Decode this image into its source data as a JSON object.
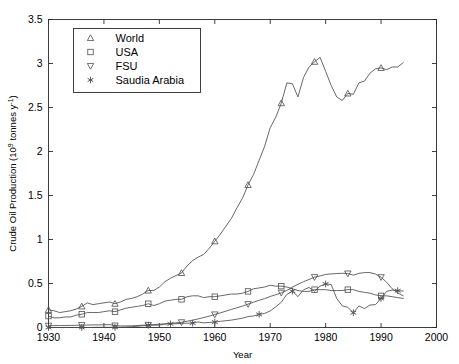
{
  "chart_data": {
    "type": "line",
    "title": "",
    "xlabel": "Year",
    "ylabel": "Crude Oil Production (10^9 tonnes y^-1)",
    "ylabel_parts": {
      "main": "Crude Oil Production (10",
      "exp1": "9",
      "mid": " tonnes y",
      "exp2": "-1",
      "tail": ")"
    },
    "xlim": [
      1930,
      2000
    ],
    "ylim": [
      0,
      3.5
    ],
    "xticks": [
      1930,
      1940,
      1950,
      1960,
      1970,
      1980,
      1990,
      2000
    ],
    "yticks": [
      0,
      0.5,
      1,
      1.5,
      2,
      2.5,
      3,
      3.5
    ],
    "xtick_labels": [
      "1930",
      "1940",
      "1950",
      "1960",
      "1970",
      "1980",
      "1990",
      "2000"
    ],
    "ytick_labels": [
      "0",
      "0.5",
      "1",
      "1.5",
      "2",
      "2.5",
      "3",
      "3.5"
    ],
    "grid": false,
    "legend_position": "upper-left",
    "line_color": "#4d4d4d",
    "series": [
      {
        "name": "World",
        "marker": "triangle-up",
        "marker_years": [
          1930,
          1936,
          1942,
          1948,
          1954,
          1960,
          1966,
          1972,
          1978,
          1984,
          1990
        ],
        "x": [
          1930,
          1931,
          1932,
          1933,
          1934,
          1935,
          1936,
          1937,
          1938,
          1939,
          1940,
          1941,
          1942,
          1943,
          1944,
          1945,
          1946,
          1947,
          1948,
          1949,
          1950,
          1951,
          1952,
          1953,
          1954,
          1955,
          1956,
          1957,
          1958,
          1959,
          1960,
          1961,
          1962,
          1963,
          1964,
          1965,
          1966,
          1967,
          1968,
          1969,
          1970,
          1971,
          1972,
          1973,
          1974,
          1975,
          1976,
          1977,
          1978,
          1979,
          1980,
          1981,
          1982,
          1983,
          1984,
          1985,
          1986,
          1987,
          1988,
          1989,
          1990,
          1991,
          1992,
          1993,
          1994
        ],
        "y": [
          0.2,
          0.19,
          0.17,
          0.18,
          0.19,
          0.21,
          0.24,
          0.28,
          0.26,
          0.27,
          0.28,
          0.29,
          0.27,
          0.29,
          0.32,
          0.33,
          0.35,
          0.38,
          0.42,
          0.42,
          0.46,
          0.52,
          0.56,
          0.59,
          0.62,
          0.7,
          0.76,
          0.8,
          0.83,
          0.9,
          0.98,
          1.06,
          1.15,
          1.24,
          1.36,
          1.47,
          1.62,
          1.74,
          1.9,
          2.06,
          2.27,
          2.39,
          2.55,
          2.78,
          2.77,
          2.62,
          2.84,
          2.96,
          3.02,
          3.07,
          2.91,
          2.75,
          2.62,
          2.58,
          2.66,
          2.65,
          2.78,
          2.8,
          2.89,
          2.94,
          2.95,
          2.93,
          2.96,
          2.96,
          3.01
        ]
      },
      {
        "name": "USA",
        "marker": "square",
        "marker_years": [
          1930,
          1936,
          1942,
          1948,
          1954,
          1960,
          1966,
          1972,
          1978,
          1984,
          1990
        ],
        "x": [
          1930,
          1931,
          1932,
          1933,
          1934,
          1935,
          1936,
          1937,
          1938,
          1939,
          1940,
          1941,
          1942,
          1943,
          1944,
          1945,
          1946,
          1947,
          1948,
          1949,
          1950,
          1951,
          1952,
          1953,
          1954,
          1955,
          1956,
          1957,
          1958,
          1959,
          1960,
          1961,
          1962,
          1963,
          1964,
          1965,
          1966,
          1967,
          1968,
          1969,
          1970,
          1971,
          1972,
          1973,
          1974,
          1975,
          1976,
          1977,
          1978,
          1979,
          1980,
          1981,
          1982,
          1983,
          1984,
          1985,
          1986,
          1987,
          1988,
          1989,
          1990,
          1991,
          1992,
          1993,
          1994
        ],
        "y": [
          0.13,
          0.11,
          0.11,
          0.12,
          0.12,
          0.14,
          0.15,
          0.17,
          0.17,
          0.17,
          0.18,
          0.19,
          0.18,
          0.2,
          0.22,
          0.23,
          0.24,
          0.25,
          0.27,
          0.25,
          0.27,
          0.3,
          0.31,
          0.32,
          0.32,
          0.35,
          0.36,
          0.36,
          0.34,
          0.35,
          0.35,
          0.36,
          0.37,
          0.38,
          0.38,
          0.39,
          0.41,
          0.44,
          0.45,
          0.46,
          0.48,
          0.47,
          0.47,
          0.46,
          0.44,
          0.42,
          0.41,
          0.41,
          0.43,
          0.43,
          0.43,
          0.42,
          0.42,
          0.42,
          0.43,
          0.43,
          0.41,
          0.4,
          0.39,
          0.37,
          0.36,
          0.36,
          0.35,
          0.34,
          0.33
        ]
      },
      {
        "name": "FSU",
        "marker": "triangle-down",
        "marker_years": [
          1930,
          1936,
          1942,
          1948,
          1954,
          1960,
          1966,
          1972,
          1978,
          1984,
          1990
        ],
        "x": [
          1930,
          1931,
          1932,
          1933,
          1934,
          1935,
          1936,
          1937,
          1938,
          1939,
          1940,
          1941,
          1942,
          1943,
          1944,
          1945,
          1946,
          1947,
          1948,
          1949,
          1950,
          1951,
          1952,
          1953,
          1954,
          1955,
          1956,
          1957,
          1958,
          1959,
          1960,
          1961,
          1962,
          1963,
          1964,
          1965,
          1966,
          1967,
          1968,
          1969,
          1970,
          1971,
          1972,
          1973,
          1974,
          1975,
          1976,
          1977,
          1978,
          1979,
          1980,
          1981,
          1982,
          1983,
          1984,
          1985,
          1986,
          1987,
          1988,
          1989,
          1990,
          1991,
          1992,
          1993,
          1994
        ],
        "y": [
          0.02,
          0.022,
          0.022,
          0.022,
          0.024,
          0.025,
          0.027,
          0.028,
          0.03,
          0.03,
          0.031,
          0.033,
          0.022,
          0.018,
          0.018,
          0.019,
          0.022,
          0.026,
          0.029,
          0.033,
          0.038,
          0.042,
          0.047,
          0.053,
          0.059,
          0.071,
          0.083,
          0.098,
          0.113,
          0.129,
          0.148,
          0.166,
          0.186,
          0.206,
          0.224,
          0.243,
          0.265,
          0.288,
          0.309,
          0.328,
          0.353,
          0.372,
          0.394,
          0.421,
          0.459,
          0.491,
          0.52,
          0.546,
          0.572,
          0.586,
          0.603,
          0.609,
          0.613,
          0.616,
          0.613,
          0.595,
          0.615,
          0.624,
          0.624,
          0.607,
          0.571,
          0.515,
          0.44,
          0.394,
          0.36
        ]
      },
      {
        "name": "Saudia Arabia",
        "marker": "asterisk",
        "marker_years": [
          1930,
          1936,
          1942,
          1948,
          1952,
          1956,
          1960,
          1968,
          1974,
          1980,
          1985,
          1990,
          1993
        ],
        "x": [
          1930,
          1931,
          1932,
          1933,
          1934,
          1935,
          1936,
          1937,
          1938,
          1939,
          1940,
          1941,
          1942,
          1943,
          1944,
          1945,
          1946,
          1947,
          1948,
          1949,
          1950,
          1951,
          1952,
          1953,
          1954,
          1955,
          1956,
          1957,
          1958,
          1959,
          1960,
          1961,
          1962,
          1963,
          1964,
          1965,
          1966,
          1967,
          1968,
          1969,
          1970,
          1971,
          1972,
          1973,
          1974,
          1975,
          1976,
          1977,
          1978,
          1979,
          1980,
          1981,
          1982,
          1983,
          1984,
          1985,
          1986,
          1987,
          1988,
          1989,
          1990,
          1991,
          1992,
          1993,
          1994
        ],
        "y": [
          0.0,
          0.0,
          0.0,
          0.0,
          0.0,
          0.0,
          0.0,
          0.0,
          0.001,
          0.002,
          0.002,
          0.002,
          0.002,
          0.003,
          0.004,
          0.009,
          0.014,
          0.02,
          0.026,
          0.026,
          0.027,
          0.038,
          0.041,
          0.043,
          0.047,
          0.049,
          0.05,
          0.063,
          0.052,
          0.057,
          0.062,
          0.07,
          0.077,
          0.084,
          0.095,
          0.106,
          0.124,
          0.131,
          0.149,
          0.16,
          0.188,
          0.234,
          0.287,
          0.376,
          0.413,
          0.351,
          0.428,
          0.455,
          0.412,
          0.47,
          0.495,
          0.488,
          0.33,
          0.246,
          0.229,
          0.168,
          0.245,
          0.215,
          0.255,
          0.26,
          0.33,
          0.41,
          0.425,
          0.418,
          0.415
        ]
      }
    ]
  },
  "legend": {
    "items": [
      {
        "label": "World",
        "marker": "triangle-up"
      },
      {
        "label": "USA",
        "marker": "square"
      },
      {
        "label": "FSU",
        "marker": "triangle-down"
      },
      {
        "label": "Saudia Arabia",
        "marker": "asterisk"
      }
    ]
  }
}
